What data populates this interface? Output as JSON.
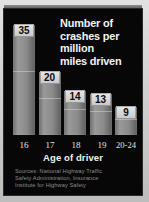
{
  "chart_data": {
    "type": "bar",
    "title": "Number of crashes per million miles driven",
    "title_lines": [
      "Number of",
      "crashes per",
      "million",
      "miles driven"
    ],
    "xlabel": "Age of driver",
    "ylabel": "",
    "categories": [
      "16",
      "17",
      "18",
      "19",
      "20-24"
    ],
    "values": [
      35,
      20,
      14,
      13,
      9
    ],
    "ylim": [
      0,
      35
    ],
    "grid": false,
    "legend": null,
    "series": [
      {
        "name": "Crashes per million miles driven",
        "values": [
          35,
          20,
          14,
          13,
          9
        ]
      }
    ],
    "annotations": [
      "Sources: National Highway Traffic Safety Administration, Insurance Institute for Highway Safety"
    ]
  },
  "colors": {
    "background": "#070707",
    "frame": "#d2d2d2",
    "bar": "#8a8a8a",
    "title_text": "#f2f2f2",
    "label_text": "#e4e4e4",
    "value_box": "#d8d8d8",
    "source_text": "#8c8c8c"
  },
  "sources": {
    "line1": "Sources: National Highway Traffic",
    "line2": "Safety Administration, Insurance",
    "line3": "Institute for Highway Safety"
  }
}
